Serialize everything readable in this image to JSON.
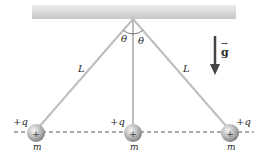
{
  "diagram": {
    "ceiling": {
      "color_top": "#e6e6e6",
      "color_bottom": "#c4c4c4"
    },
    "pivot": {
      "x": 133,
      "y": 19
    },
    "string_length_label": "L",
    "angle_label": "θ",
    "gravity": {
      "label": "g",
      "vector_arrow": "→"
    },
    "spheres": [
      {
        "id": "left",
        "charge_label": "+q",
        "mass_label": "m",
        "symbol": "+"
      },
      {
        "id": "center",
        "charge_label": "+q",
        "mass_label": "m",
        "symbol": "+"
      },
      {
        "id": "right",
        "charge_label": "+q",
        "mass_label": "m",
        "symbol": "+"
      }
    ],
    "colors": {
      "string": "#bdbdbd",
      "sphere_light": "#e8e8e8",
      "sphere_dark": "#8a8a8a",
      "dashed_line": "#555555",
      "arrow": "#444444",
      "text": "#2a2a2a"
    }
  }
}
